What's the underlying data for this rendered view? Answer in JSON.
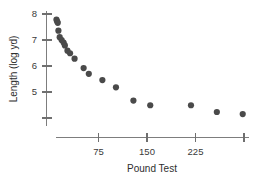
{
  "chart_data": {
    "type": "scatter",
    "title": "",
    "subtitle": "",
    "xlabel": "Pound Test",
    "ylabel": "Length (log yd)",
    "xlim": [
      0,
      310
    ],
    "ylim": [
      3.9,
      8.2
    ],
    "grid": false,
    "legend": null,
    "x_ticks": [
      {
        "value": 75,
        "label": "75"
      },
      {
        "value": 150,
        "label": "150"
      },
      {
        "value": 225,
        "label": "225"
      },
      {
        "value": 300,
        "label": ""
      }
    ],
    "y_ticks": [
      {
        "value": 8,
        "label": "8"
      },
      {
        "value": 7,
        "label": "7"
      },
      {
        "value": 6,
        "label": "6"
      },
      {
        "value": 5,
        "label": "5"
      },
      {
        "value": 4,
        "label": ""
      }
    ],
    "marker": {
      "shape": "circle",
      "color": "#4a4a4a",
      "size": 3.1
    },
    "series": [
      {
        "name": "Fishing line",
        "points": [
          {
            "x": 10,
            "y": 7.78
          },
          {
            "x": 11,
            "y": 7.72
          },
          {
            "x": 12,
            "y": 7.66
          },
          {
            "x": 13,
            "y": 7.36
          },
          {
            "x": 15,
            "y": 7.11
          },
          {
            "x": 18,
            "y": 7.0
          },
          {
            "x": 21,
            "y": 6.9
          },
          {
            "x": 23,
            "y": 6.79
          },
          {
            "x": 27,
            "y": 6.59
          },
          {
            "x": 31,
            "y": 6.49
          },
          {
            "x": 38,
            "y": 6.28
          },
          {
            "x": 52,
            "y": 5.92
          },
          {
            "x": 60,
            "y": 5.7
          },
          {
            "x": 81,
            "y": 5.46
          },
          {
            "x": 102,
            "y": 5.18
          },
          {
            "x": 129,
            "y": 4.67
          },
          {
            "x": 155,
            "y": 4.49
          },
          {
            "x": 218,
            "y": 4.49
          },
          {
            "x": 258,
            "y": 4.23
          },
          {
            "x": 298,
            "y": 4.15
          }
        ]
      }
    ]
  },
  "axes": {
    "x_title": "Pound Test",
    "y_title": "Length (log yd)"
  }
}
